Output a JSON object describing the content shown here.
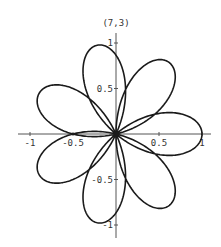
{
  "chart_data": {
    "type": "line",
    "title": "(7,3)",
    "equation": "r = cos(7*theta/3)",
    "rose_params": {
      "n": 7,
      "d": 3
    },
    "theta_range": [
      0,
      18.8496
    ],
    "xlabel": "",
    "ylabel": "",
    "xlim": [
      -1.1,
      1.1
    ],
    "ylim": [
      -1.1,
      1.05
    ],
    "x_ticks": [
      -1,
      -0.5,
      0.5,
      1
    ],
    "x_tick_labels": [
      "-1",
      "-0.5",
      "0.5",
      "1"
    ],
    "y_ticks": [
      1,
      0.5,
      -0.5,
      -1
    ],
    "y_tick_labels": [
      "1",
      "0.5",
      "-0.5",
      "-1"
    ],
    "petal_count": 7,
    "petal_angles_deg": [
      0,
      51.4,
      102.9,
      154.3,
      205.7,
      257.1,
      308.6
    ],
    "grid": false,
    "legend": null,
    "line_color": "#1a1a1a"
  },
  "plot": {
    "origin_px": [
      116,
      134
    ],
    "scale_x_px": 86,
    "scale_y_px": 91,
    "x_axis_px": [
      18,
      211
    ],
    "y_axis_px": [
      33,
      238
    ]
  }
}
